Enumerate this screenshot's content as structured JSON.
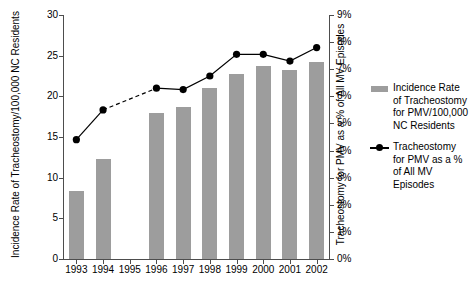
{
  "chart_data": {
    "type": "bar",
    "title": "",
    "xlabel": "",
    "ylabel": "Incidence Rate of Tracheostomy/100,000 NC Residents",
    "y2label": "Tracheostomy for PMV as a % of All MV Episodes",
    "categories": [
      "1993",
      "1994",
      "1995",
      "1996",
      "1997",
      "1998",
      "1999",
      "2000",
      "2001",
      "2002"
    ],
    "ylim": [
      0,
      30
    ],
    "yticks": [
      "0",
      "5",
      "10",
      "15",
      "20",
      "25",
      "30"
    ],
    "y2lim": [
      0,
      9
    ],
    "y2ticks": [
      "0%",
      "1%",
      "2%",
      "3%",
      "4%",
      "5%",
      "6%",
      "7%",
      "8%",
      "9%"
    ],
    "grid": false,
    "legend_position": "right",
    "series": [
      {
        "name": "Incidence Rate of Tracheostomy for PMV/100,000 NC Residents",
        "type": "bar",
        "axis": "left",
        "color": "#9d9d9d",
        "values": [
          8.4,
          12.3,
          null,
          18.0,
          18.7,
          21.0,
          22.7,
          23.7,
          23.2,
          24.2
        ]
      },
      {
        "name": "Tracheostomy for PMV as a % of All MV Episodes",
        "type": "line",
        "axis": "right",
        "color": "#000000",
        "values": [
          4.4,
          5.5,
          null,
          6.3,
          6.25,
          6.75,
          7.55,
          7.55,
          7.3,
          7.8
        ]
      }
    ]
  },
  "legend": {
    "entries": [
      {
        "marker": "bar-swatch",
        "label": "Incidence Rate of Tracheostomy for PMV/100,000 NC Residents"
      },
      {
        "marker": "line-dot-swatch",
        "label": "Tracheostomy for PMV as a % of All MV Episodes"
      }
    ]
  }
}
